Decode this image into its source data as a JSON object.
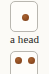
{
  "figure": {
    "background_color": "#fbfaf6",
    "caption": "a head",
    "caption_color": "#1f1d1b"
  },
  "chart_data": {
    "type": "diagram",
    "title": "a head",
    "elements": [
      {
        "name": "die-top",
        "shape": "rounded-square",
        "face_value": 1,
        "pip_positions": [
          "center"
        ],
        "pip_color": "#8c4a20",
        "face_color": "#fefdfa",
        "border_color": "#b9b7b0",
        "cropped": false
      },
      {
        "name": "caption",
        "shape": "text",
        "text": "a head",
        "color": "#1f1d1b"
      },
      {
        "name": "die-bottom",
        "shape": "rounded-square",
        "face_value": 2,
        "pip_positions": [
          "top-left",
          "top-right"
        ],
        "pip_color": "#8c4a20",
        "face_color": "#fefdfa",
        "border_color": "#b9b7b0",
        "cropped": true
      }
    ]
  }
}
